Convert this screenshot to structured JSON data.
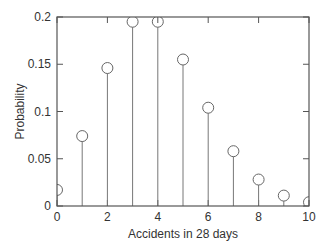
{
  "chart_data": {
    "type": "stem",
    "title": "",
    "xlabel": "Accidents in 28 days",
    "ylabel": "Probability",
    "xlim": [
      0,
      10
    ],
    "ylim": [
      0,
      0.2
    ],
    "x_ticks": [
      0,
      2,
      4,
      6,
      8,
      10
    ],
    "x_tick_labels": [
      "0",
      "2",
      "4",
      "6",
      "8",
      "10"
    ],
    "y_ticks": [
      0,
      0.05,
      0.1,
      0.15,
      0.2
    ],
    "y_tick_labels": [
      "0",
      "0.05",
      "0.1",
      "0.15",
      "0.2"
    ],
    "grid": false,
    "legend": null,
    "marker": "open-circle",
    "x": [
      0,
      1,
      2,
      3,
      4,
      5,
      6,
      7,
      8,
      9,
      10
    ],
    "values": [
      0.017,
      0.074,
      0.146,
      0.195,
      0.195,
      0.155,
      0.104,
      0.058,
      0.028,
      0.011,
      0.004
    ]
  },
  "style": {
    "axis_color": "#555555",
    "stem_color": "#777777",
    "marker_color": "#666666"
  }
}
